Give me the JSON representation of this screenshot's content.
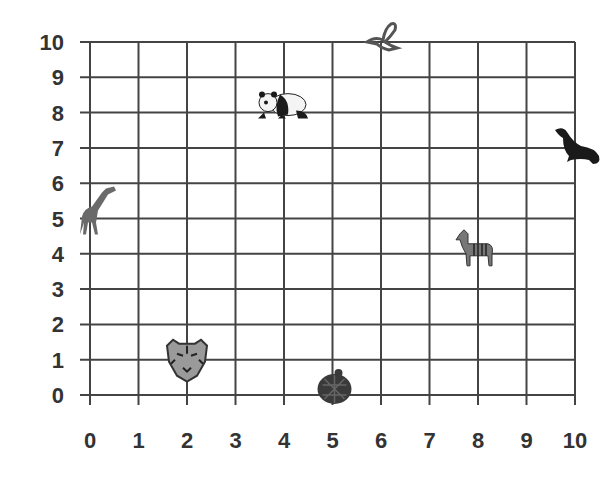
{
  "chart_data": {
    "type": "scatter",
    "title": "",
    "xlabel": "",
    "ylabel": "",
    "xlim": [
      0,
      10
    ],
    "ylim": [
      0,
      10
    ],
    "grid": true,
    "legend": null,
    "x_ticks": [
      0,
      1,
      2,
      3,
      4,
      5,
      6,
      7,
      8,
      9,
      10
    ],
    "y_ticks": [
      0,
      1,
      2,
      3,
      4,
      5,
      6,
      7,
      8,
      9,
      10
    ],
    "points": [
      {
        "name": "giraffe",
        "x": 0,
        "y": 5
      },
      {
        "name": "tiger",
        "x": 2,
        "y": 1
      },
      {
        "name": "panda",
        "x": 4,
        "y": 8
      },
      {
        "name": "turtle",
        "x": 5,
        "y": 0
      },
      {
        "name": "bird",
        "x": 6,
        "y": 10
      },
      {
        "name": "zebra",
        "x": 8,
        "y": 4
      },
      {
        "name": "seal",
        "x": 10,
        "y": 7
      }
    ]
  },
  "colors": {
    "grid": "#444444",
    "labels": "#333333",
    "animal_dark": "#1a1a1a",
    "animal_gray": "#6a6a6a"
  }
}
